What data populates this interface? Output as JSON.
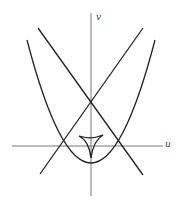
{
  "diagram": {
    "axes": {
      "x_label": "u",
      "y_label": "v"
    },
    "elements": [
      {
        "type": "axis",
        "name": "u-axis"
      },
      {
        "type": "axis",
        "name": "v-axis"
      },
      {
        "type": "parabola",
        "name": "upward parabola",
        "vertex": "below origin"
      },
      {
        "type": "line",
        "name": "line with negative slope"
      },
      {
        "type": "line",
        "name": "line with positive slope"
      },
      {
        "type": "deltoid",
        "name": "three-cusped curve near origin"
      }
    ],
    "colors": {
      "curve": "#222222",
      "axis": "#555555",
      "background": "#ffffff"
    }
  }
}
